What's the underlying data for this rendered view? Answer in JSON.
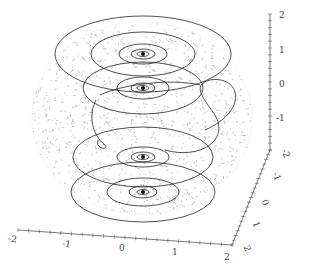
{
  "chart_data": {
    "type": "3d-surface-vector-field",
    "title": "",
    "axes": {
      "x": {
        "label": "",
        "range": [
          -2,
          2
        ],
        "ticks": [
          "-2",
          "-1",
          "0",
          "1",
          "2"
        ]
      },
      "y": {
        "label": "",
        "range": [
          -2,
          2
        ],
        "ticks": [
          "-2",
          "-1",
          "0",
          "1",
          "2"
        ]
      },
      "z": {
        "label": "",
        "range": [
          -2,
          2
        ],
        "ticks": [
          "2",
          "1",
          "0",
          "-1",
          "-2"
        ]
      }
    },
    "grid": false,
    "legend": null,
    "foci": [
      {
        "name": "top-focus",
        "z": 1.6
      },
      {
        "name": "upper-mid-focus",
        "z": 0.6
      },
      {
        "name": "lower-mid-focus",
        "z": -0.7
      },
      {
        "name": "bottom-focus",
        "z": -1.6
      }
    ],
    "colors": {
      "trajectory": "#222222",
      "field": "#888888",
      "axis": "#555555"
    }
  },
  "labels": {
    "z_ticks": [
      "2",
      "1",
      "0",
      "-1",
      "-2"
    ],
    "y_ticks": [
      "-2",
      "-1",
      "0",
      "1",
      "2"
    ],
    "x_ticks": [
      "-2",
      "-1",
      "0",
      "1",
      "2"
    ]
  }
}
